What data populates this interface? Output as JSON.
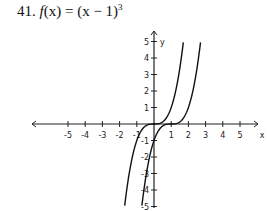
{
  "problem": {
    "number": "41.",
    "fname": "f",
    "arg": "(x)",
    "eq": " = (x − 1)",
    "exp": "3"
  },
  "chart_data": {
    "type": "line",
    "xlabel": "x",
    "ylabel": "y",
    "xlim": [
      -5,
      5
    ],
    "ylim": [
      -5,
      5
    ],
    "x_ticks": [
      -5,
      -4,
      -3,
      -2,
      -1,
      1,
      2,
      3,
      4,
      5
    ],
    "y_ticks": [
      -5,
      -4,
      -3,
      -2,
      -1,
      1,
      2,
      3,
      4,
      5
    ],
    "grid": false,
    "series": [
      {
        "name": "y = x^3 (parent)",
        "x": [
          -1.7,
          -1.5,
          -1,
          -0.5,
          0,
          0.5,
          1,
          1.5,
          1.7
        ],
        "y": [
          -4.91,
          -3.375,
          -1,
          -0.125,
          0,
          0.125,
          1,
          3.375,
          4.91
        ]
      },
      {
        "name": "f(x) = (x - 1)^3",
        "x": [
          -0.7,
          -0.5,
          0,
          0.5,
          1,
          1.5,
          2,
          2.5,
          2.7
        ],
        "y": [
          -4.91,
          -3.375,
          -1,
          -0.125,
          0,
          0.125,
          1,
          3.375,
          4.91
        ]
      }
    ]
  },
  "axis": {
    "x_label": "x",
    "y_label": "y",
    "x_ticks": [
      "-5",
      "-4",
      "-3",
      "-2",
      "-1",
      "1",
      "2",
      "3",
      "4",
      "5"
    ],
    "y_ticks": [
      "5",
      "4",
      "3",
      "2",
      "1",
      "-1",
      "-2",
      "-3",
      "-4",
      "-5"
    ]
  }
}
